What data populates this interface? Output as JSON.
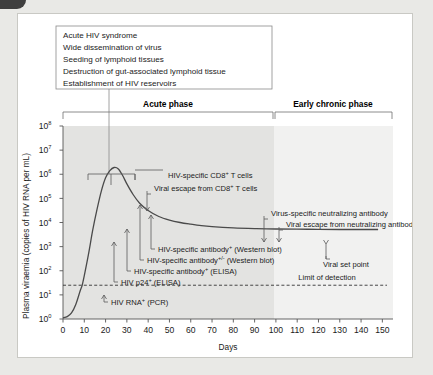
{
  "figure": {
    "callout_box": {
      "lines": [
        "Acute HIV syndrome",
        "Wide dissemination of virus",
        "Seeding of lymphoid tissues",
        "Destruction of gut-associated lymphoid tissue",
        "Establishment of HIV reservoirs"
      ]
    },
    "phases": [
      {
        "label": "Acute phase",
        "start_day": 0,
        "end_day": 100
      },
      {
        "label": "Early chronic phase",
        "start_day": 100,
        "end_day": 150
      }
    ]
  },
  "chart_data": {
    "type": "line",
    "title": "",
    "xlabel": "Days",
    "ylabel": "Plasma viraemia (copies of HIV RNA per mL)",
    "xlim": [
      0,
      155
    ],
    "ylim": [
      0,
      8
    ],
    "xticks": [
      0,
      10,
      20,
      30,
      40,
      50,
      60,
      70,
      80,
      90,
      100,
      110,
      120,
      130,
      140,
      150
    ],
    "xtick_labels": [
      "0",
      "10",
      "20",
      "30",
      "40",
      "50",
      "60",
      "70",
      "80",
      "90",
      "100",
      "110",
      "120",
      "130",
      "140",
      "150"
    ],
    "yticks": [
      0,
      1,
      2,
      3,
      4,
      5,
      6,
      7,
      8
    ],
    "ytick_labels": [
      "10",
      "10",
      "10",
      "10",
      "10",
      "10",
      "10",
      "10",
      "10"
    ],
    "ytick_exponents": [
      "0",
      "1",
      "2",
      "3",
      "4",
      "5",
      "6",
      "7",
      "8"
    ],
    "y_scale": "log10",
    "grid": false,
    "legend": false,
    "series": [
      {
        "name": "Plasma viraemia",
        "points": [
          [
            0,
            0.05
          ],
          [
            2,
            0.1
          ],
          [
            4,
            0.25
          ],
          [
            6,
            0.6
          ],
          [
            8,
            1.15
          ],
          [
            9,
            1.4
          ],
          [
            10,
            1.8
          ],
          [
            12,
            2.7
          ],
          [
            14,
            3.7
          ],
          [
            16,
            4.55
          ],
          [
            18,
            5.3
          ],
          [
            20,
            5.85
          ],
          [
            22,
            6.15
          ],
          [
            24,
            6.28
          ],
          [
            26,
            6.22
          ],
          [
            28,
            5.95
          ],
          [
            30,
            5.6
          ],
          [
            33,
            5.15
          ],
          [
            36,
            4.8
          ],
          [
            40,
            4.5
          ],
          [
            45,
            4.25
          ],
          [
            50,
            4.1
          ],
          [
            55,
            4.0
          ],
          [
            60,
            3.93
          ],
          [
            65,
            3.87
          ],
          [
            70,
            3.83
          ],
          [
            80,
            3.78
          ],
          [
            90,
            3.75
          ],
          [
            100,
            3.73
          ],
          [
            115,
            3.72
          ],
          [
            130,
            3.71
          ],
          [
            148,
            3.71
          ]
        ]
      }
    ],
    "threshold_line": {
      "label": "Limit of detection",
      "value": 1.4,
      "style": "dashed",
      "label_x_day": 124
    },
    "annotations": [
      {
        "name": "hiv-specific-cd8-t-cells",
        "text": "HIV-specific CD8",
        "sup": "+",
        "text2": " T cells",
        "label_x": 150,
        "label_y": 164,
        "bracket": {
          "x1": 70,
          "x2": 117,
          "y": 160,
          "stem_x": 93,
          "stem_y2": 171
        }
      },
      {
        "name": "viral-escape-from-cd8-t-cells",
        "text": "Viral escape from CD8",
        "sup": "+",
        "text2": " T cells",
        "label_x": 136,
        "label_y": 177,
        "arrow": {
          "x": 133,
          "y1": 180,
          "y2": 197
        }
      },
      {
        "name": "virus-specific-neutralizing-antibody",
        "text": "Virus-specific neutralizing antibody",
        "sup": "",
        "text2": "",
        "label_x": 253,
        "label_y": 202,
        "arrow": {
          "x": 250,
          "y1": 205,
          "y2": 228
        }
      },
      {
        "name": "viral-escape-from-neutralizing-antibody",
        "text": "Viral escape from neutralizing antibody",
        "sup": "",
        "text2": "",
        "label_x": 268,
        "label_y": 213,
        "arrow": {
          "x": 265,
          "y1": 216,
          "y2": 228
        }
      },
      {
        "name": "hiv-specific-antibody-western-blot",
        "text": "HIV-specific antibody",
        "sup": "+",
        "text2": " (Western blot)",
        "label_x": 140,
        "label_y": 238,
        "leader": {
          "x": 137,
          "y2": 201
        }
      },
      {
        "name": "hiv-specific-antibody-pm-western-blot",
        "text": "HIV-specific antibody",
        "sup": "+/-",
        "text2": " (Western blot)",
        "label_x": 129,
        "label_y": 249,
        "leader": {
          "x": 126,
          "y2": 191
        }
      },
      {
        "name": "hiv-specific-antibody-elisa",
        "text": "HIV-specific antibody",
        "sup": "+",
        "text2": " (ELISA)",
        "label_x": 116,
        "label_y": 260,
        "leader": {
          "x": 113,
          "y2": 215
        }
      },
      {
        "name": "hiv-p24-elisa",
        "text": "HIV p24",
        "sup": "+",
        "text2": " (ELISA)",
        "label_x": 103,
        "label_y": 271,
        "leader": {
          "x": 100,
          "y2": 228
        }
      },
      {
        "name": "hiv-rna-pcr",
        "text": "HIV RNA",
        "sup": "+",
        "text2": " (PCR)",
        "label_x": 93,
        "label_y": 291,
        "leader": {
          "x": 90,
          "y2": 281
        }
      },
      {
        "name": "viral-set-point",
        "text": "Viral set point",
        "sup": "",
        "text2": "",
        "label_x": 305,
        "label_y": 253,
        "arrow": {
          "x": 312,
          "y1": 245,
          "y2": 230
        }
      }
    ]
  }
}
